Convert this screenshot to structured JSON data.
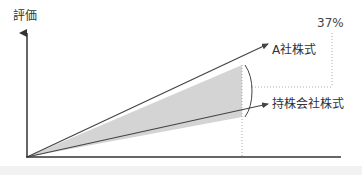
{
  "diagram": {
    "y_axis_label": "評価",
    "percentage_label": "37%",
    "series": [
      {
        "name": "A社株式",
        "end": [
          268,
          44
        ]
      },
      {
        "name": "持株会社株式",
        "end": [
          268,
          104
        ]
      }
    ],
    "shaded_gap_color": "#d4d4d4",
    "line_color": "#444444",
    "axis_color": "#333333"
  }
}
